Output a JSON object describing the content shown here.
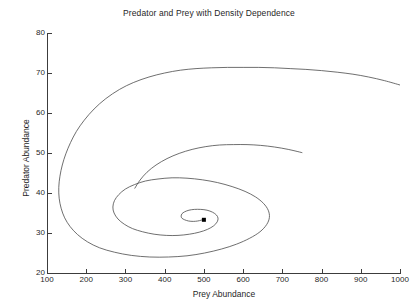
{
  "chart_data": {
    "type": "line",
    "title": "Predator and Prey with Density Dependence",
    "xlabel": "Prey Abundance",
    "ylabel": "Predator Abundance",
    "xlim": [
      100,
      1000
    ],
    "ylim": [
      20,
      80
    ],
    "xticks": [
      100,
      200,
      300,
      400,
      500,
      600,
      700,
      800,
      900,
      1000
    ],
    "yticks": [
      20,
      30,
      40,
      50,
      60,
      70,
      80
    ],
    "grid": false,
    "legend": null,
    "line_color": "#4a4a4a",
    "marker_color": "#000000",
    "background_color": "#ffffff",
    "axis_color": "#3c3c3c",
    "series": [
      {
        "name": "Predator-prey trajectory",
        "description": "Inward spiral converging to a stable equilibrium",
        "points": [
          [
            1000,
            67.0
          ],
          [
            960,
            68.1
          ],
          [
            920,
            69.0
          ],
          [
            880,
            69.7
          ],
          [
            840,
            70.2
          ],
          [
            800,
            70.6
          ],
          [
            760,
            70.9
          ],
          [
            720,
            71.1
          ],
          [
            680,
            71.3
          ],
          [
            640,
            71.4
          ],
          [
            600,
            71.4
          ],
          [
            560,
            71.4
          ],
          [
            520,
            71.3
          ],
          [
            480,
            71.1
          ],
          [
            440,
            70.7
          ],
          [
            400,
            70.0
          ],
          [
            360,
            69.0
          ],
          [
            320,
            67.6
          ],
          [
            285,
            65.9
          ],
          [
            250,
            63.6
          ],
          [
            220,
            61.0
          ],
          [
            195,
            58.2
          ],
          [
            175,
            55.4
          ],
          [
            160,
            52.6
          ],
          [
            148,
            49.8
          ],
          [
            139,
            47.0
          ],
          [
            133,
            44.2
          ],
          [
            130,
            41.4
          ],
          [
            131,
            38.7
          ],
          [
            136,
            36.2
          ],
          [
            145,
            33.8
          ],
          [
            159,
            31.6
          ],
          [
            178,
            29.6
          ],
          [
            203,
            27.8
          ],
          [
            234,
            26.3
          ],
          [
            272,
            25.2
          ],
          [
            315,
            24.4
          ],
          [
            362,
            24.0
          ],
          [
            410,
            24.0
          ],
          [
            457,
            24.3
          ],
          [
            502,
            25.0
          ],
          [
            545,
            26.0
          ],
          [
            583,
            27.2
          ],
          [
            617,
            28.7
          ],
          [
            643,
            30.3
          ],
          [
            660,
            32.1
          ],
          [
            667,
            33.9
          ],
          [
            664,
            35.7
          ],
          [
            652,
            37.4
          ],
          [
            632,
            39.0
          ],
          [
            605,
            40.4
          ],
          [
            572,
            41.6
          ],
          [
            535,
            42.6
          ],
          [
            496,
            43.3
          ],
          [
            457,
            43.7
          ],
          [
            419,
            43.8
          ],
          [
            383,
            43.5
          ],
          [
            351,
            43.0
          ],
          [
            323,
            42.1
          ],
          [
            300,
            41.0
          ],
          [
            283,
            39.6
          ],
          [
            272,
            38.1
          ],
          [
            268,
            36.5
          ],
          [
            271,
            35.0
          ],
          [
            281,
            33.5
          ],
          [
            297,
            32.2
          ],
          [
            318,
            31.1
          ],
          [
            344,
            30.3
          ],
          [
            373,
            29.7
          ],
          [
            404,
            29.4
          ],
          [
            434,
            29.4
          ],
          [
            463,
            29.7
          ],
          [
            488,
            30.2
          ],
          [
            509,
            30.9
          ],
          [
            525,
            31.8
          ],
          [
            534,
            32.8
          ],
          [
            536,
            33.7
          ],
          [
            532,
            34.5
          ],
          [
            522,
            35.2
          ],
          [
            508,
            35.7
          ],
          [
            492,
            35.9
          ],
          [
            476,
            35.9
          ],
          [
            462,
            35.7
          ],
          [
            451,
            35.3
          ],
          [
            444,
            34.8
          ],
          [
            442,
            34.2
          ],
          [
            444,
            33.7
          ],
          [
            451,
            33.3
          ],
          [
            461,
            33.0
          ],
          [
            473,
            32.9
          ],
          [
            484,
            33.0
          ],
          [
            493,
            33.2
          ],
          [
            499,
            33.4
          ],
          [
            500,
            33.5
          ]
        ]
      },
      {
        "name": "Outer branch (second arm)",
        "description": "Upper arm of the spiral terminating near 750 prey",
        "points": [
          [
            750,
            50.1
          ],
          [
            715,
            50.9
          ],
          [
            680,
            51.5
          ],
          [
            645,
            51.9
          ],
          [
            610,
            52.1
          ],
          [
            575,
            52.1
          ],
          [
            540,
            52.0
          ],
          [
            505,
            51.6
          ],
          [
            470,
            50.9
          ],
          [
            437,
            49.9
          ],
          [
            406,
            48.6
          ],
          [
            378,
            47.0
          ],
          [
            355,
            45.2
          ],
          [
            337,
            43.2
          ],
          [
            324,
            41.2
          ]
        ]
      }
    ],
    "equilibrium_point": {
      "x": 500,
      "y": 33.3,
      "marker": "square",
      "size": 4
    },
    "annotations": []
  },
  "axes": {
    "y_ticklabels": [
      "20",
      "30",
      "40",
      "50",
      "60",
      "70",
      "80"
    ],
    "x_ticklabels": [
      "100",
      "200",
      "300",
      "400",
      "500",
      "600",
      "700",
      "800",
      "900",
      "1000"
    ]
  }
}
